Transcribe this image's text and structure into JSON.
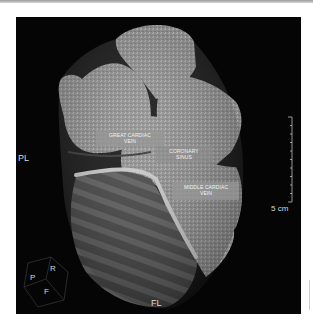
{
  "image": {
    "subject": "3D volume-rendered heart (posterior view)",
    "annotations": [
      {
        "id": "great-cardiac-vein",
        "text_line1": "GREAT CARDIAC",
        "text_line2": "VEIN"
      },
      {
        "id": "coronary-sinus",
        "text_line1": "CORONARY",
        "text_line2": "SINUS"
      },
      {
        "id": "middle-cardiac-vein",
        "text_line1": "MIDDLE CARDIAC",
        "text_line2": "VEIN"
      }
    ],
    "orientation_labels": {
      "left": "PL",
      "bottom": "FL"
    },
    "orientation_cube": {
      "p": "P",
      "r": "R",
      "f": "F"
    },
    "scale_bar": {
      "label": "5 cm",
      "ticks": 10
    },
    "colors": {
      "background": "#050505",
      "label_box": "#969696",
      "text": "#d8d8d8"
    }
  }
}
